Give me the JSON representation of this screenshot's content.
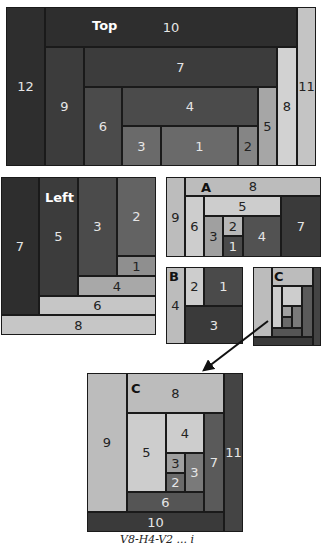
{
  "colors": {
    "g1": "#2e2e2e",
    "g2": "#383838",
    "g3": "#444444",
    "g4": "#525252",
    "g5": "#636363",
    "g6": "#777777",
    "g7": "#8f8f8f",
    "g8": "#a8a8a8",
    "g9": "#bcbcbc",
    "g10": "#cdcdcd"
  },
  "diagrams": [
    {
      "id": "top",
      "tag": {
        "label": "Top",
        "x": 92,
        "y": 18,
        "color": "#ffffff"
      },
      "cells": [
        {
          "label": "12",
          "x": 6,
          "y": 7,
          "w": 39,
          "h": 159,
          "bg": "#2e2e2e",
          "fg": "#e6e6e6"
        },
        {
          "label": "10",
          "x": 45,
          "y": 7,
          "w": 252,
          "h": 40,
          "bg": "#2e2e2e",
          "fg": "#e6e6e6"
        },
        {
          "label": "11",
          "x": 297,
          "y": 7,
          "w": 19,
          "h": 159,
          "bg": "#c4c4c4",
          "fg": "#222222"
        },
        {
          "label": "9",
          "x": 45,
          "y": 47,
          "w": 39,
          "h": 119,
          "bg": "#3c3c3c",
          "fg": "#e6e6e6"
        },
        {
          "label": "7",
          "x": 84,
          "y": 47,
          "w": 193,
          "h": 40,
          "bg": "#3c3c3c",
          "fg": "#e6e6e6"
        },
        {
          "label": "8",
          "x": 277,
          "y": 47,
          "w": 20,
          "h": 119,
          "bg": "#d2d2d2",
          "fg": "#222222"
        },
        {
          "label": "6",
          "x": 84,
          "y": 87,
          "w": 38,
          "h": 79,
          "bg": "#4b4b4b",
          "fg": "#e6e6e6"
        },
        {
          "label": "4",
          "x": 122,
          "y": 87,
          "w": 136,
          "h": 39,
          "bg": "#4b4b4b",
          "fg": "#e6e6e6"
        },
        {
          "label": "5",
          "x": 258,
          "y": 87,
          "w": 19,
          "h": 79,
          "bg": "#a6a6a6",
          "fg": "#222222"
        },
        {
          "label": "3",
          "x": 122,
          "y": 126,
          "w": 39,
          "h": 40,
          "bg": "#6a6a6a",
          "fg": "#e6e6e6"
        },
        {
          "label": "1",
          "x": 161,
          "y": 126,
          "w": 77,
          "h": 40,
          "bg": "#6a6a6a",
          "fg": "#e6e6e6"
        },
        {
          "label": "2",
          "x": 238,
          "y": 126,
          "w": 20,
          "h": 40,
          "bg": "#858585",
          "fg": "#222222"
        }
      ]
    },
    {
      "id": "left",
      "tag": {
        "label": "Left",
        "x": 45,
        "y": 190,
        "color": "#ffffff"
      },
      "cells": [
        {
          "label": "7",
          "x": 1,
          "y": 177,
          "w": 38,
          "h": 138,
          "bg": "#2e2e2e",
          "fg": "#e6e6e6"
        },
        {
          "label": "5",
          "x": 39,
          "y": 177,
          "w": 39,
          "h": 119,
          "bg": "#3c3c3c",
          "fg": "#e6e6e6"
        },
        {
          "label": "3",
          "x": 78,
          "y": 177,
          "w": 39,
          "h": 99,
          "bg": "#4b4b4b",
          "fg": "#e6e6e6"
        },
        {
          "label": "2",
          "x": 117,
          "y": 177,
          "w": 39,
          "h": 79,
          "bg": "#636363",
          "fg": "#e6e6e6"
        },
        {
          "label": "1",
          "x": 117,
          "y": 256,
          "w": 39,
          "h": 20,
          "bg": "#8f8f8f",
          "fg": "#222222"
        },
        {
          "label": "4",
          "x": 78,
          "y": 276,
          "w": 78,
          "h": 20,
          "bg": "#a8a8a8",
          "fg": "#222222"
        },
        {
          "label": "6",
          "x": 39,
          "y": 296,
          "w": 117,
          "h": 19,
          "bg": "#c6c6c6",
          "fg": "#222222"
        },
        {
          "label": "8",
          "x": 1,
          "y": 315,
          "w": 155,
          "h": 20,
          "bg": "#c6c6c6",
          "fg": "#222222"
        }
      ]
    },
    {
      "id": "a",
      "tag": {
        "label": "A",
        "x": 201,
        "y": 180,
        "color": "#111111"
      },
      "cells": [
        {
          "label": "9",
          "x": 166,
          "y": 177,
          "w": 19,
          "h": 80,
          "bg": "#bcbcbc",
          "fg": "#222222"
        },
        {
          "label": "8",
          "x": 185,
          "y": 177,
          "w": 136,
          "h": 19,
          "bg": "#bcbcbc",
          "fg": "#222222"
        },
        {
          "label": "6",
          "x": 185,
          "y": 196,
          "w": 19,
          "h": 61,
          "bg": "#cdcdcd",
          "fg": "#222222"
        },
        {
          "label": "5",
          "x": 204,
          "y": 196,
          "w": 77,
          "h": 20,
          "bg": "#cdcdcd",
          "fg": "#222222"
        },
        {
          "label": "7",
          "x": 281,
          "y": 196,
          "w": 40,
          "h": 61,
          "bg": "#3a3a3a",
          "fg": "#e6e6e6"
        },
        {
          "label": "3",
          "x": 204,
          "y": 216,
          "w": 19,
          "h": 41,
          "bg": "#a0a0a0",
          "fg": "#222222"
        },
        {
          "label": "2",
          "x": 223,
          "y": 216,
          "w": 20,
          "h": 20,
          "bg": "#b8b8b8",
          "fg": "#222222"
        },
        {
          "label": "1",
          "x": 223,
          "y": 236,
          "w": 20,
          "h": 21,
          "bg": "#4a4a4a",
          "fg": "#e6e6e6"
        },
        {
          "label": "4",
          "x": 243,
          "y": 216,
          "w": 38,
          "h": 41,
          "bg": "#525252",
          "fg": "#e6e6e6"
        }
      ]
    },
    {
      "id": "b",
      "tag": {
        "label": "B",
        "x": 169,
        "y": 269,
        "color": "#111111"
      },
      "cells": [
        {
          "label": "4",
          "x": 166,
          "y": 267,
          "w": 19,
          "h": 77,
          "bg": "#bcbcbc",
          "fg": "#222222"
        },
        {
          "label": "2",
          "x": 185,
          "y": 267,
          "w": 19,
          "h": 39,
          "bg": "#cdcdcd",
          "fg": "#222222"
        },
        {
          "label": "1",
          "x": 204,
          "y": 267,
          "w": 39,
          "h": 39,
          "bg": "#4a4a4a",
          "fg": "#e6e6e6"
        },
        {
          "label": "3",
          "x": 185,
          "y": 306,
          "w": 58,
          "h": 38,
          "bg": "#3a3a3a",
          "fg": "#e6e6e6"
        }
      ]
    },
    {
      "id": "c-small",
      "tag": {
        "label": "C",
        "x": 274,
        "y": 269,
        "color": "#111111"
      },
      "cells": [
        {
          "label": "",
          "x": 253,
          "y": 267,
          "w": 19,
          "h": 70,
          "bg": "#bcbcbc",
          "fg": "#222222"
        },
        {
          "label": "",
          "x": 272,
          "y": 267,
          "w": 41,
          "h": 19,
          "bg": "#bcbcbc",
          "fg": "#222222"
        },
        {
          "label": "",
          "x": 313,
          "y": 267,
          "w": 8,
          "h": 79,
          "bg": "#444444",
          "fg": "#e6e6e6"
        },
        {
          "label": "",
          "x": 253,
          "y": 337,
          "w": 60,
          "h": 9,
          "bg": "#3a3a3a",
          "fg": "#e6e6e6"
        },
        {
          "label": "",
          "x": 272,
          "y": 286,
          "w": 10,
          "h": 42,
          "bg": "#cdcdcd",
          "fg": "#222222"
        },
        {
          "label": "",
          "x": 282,
          "y": 286,
          "w": 20,
          "h": 20,
          "bg": "#cdcdcd",
          "fg": "#222222"
        },
        {
          "label": "",
          "x": 302,
          "y": 286,
          "w": 11,
          "h": 51,
          "bg": "#5a5a5a",
          "fg": "#e6e6e6"
        },
        {
          "label": "",
          "x": 272,
          "y": 328,
          "w": 30,
          "h": 9,
          "bg": "#555555",
          "fg": "#e6e6e6"
        },
        {
          "label": "",
          "x": 282,
          "y": 306,
          "w": 10,
          "h": 11,
          "bg": "#a0a0a0",
          "fg": "#222222"
        },
        {
          "label": "",
          "x": 282,
          "y": 317,
          "w": 10,
          "h": 11,
          "bg": "#6a6a6a",
          "fg": "#e6e6e6"
        },
        {
          "label": "",
          "x": 292,
          "y": 306,
          "w": 10,
          "h": 22,
          "bg": "#7a7a7a",
          "fg": "#e6e6e6"
        }
      ]
    },
    {
      "id": "c-large",
      "tag": {
        "label": "C",
        "x": 131,
        "y": 381,
        "color": "#111111"
      },
      "cells": [
        {
          "label": "9",
          "x": 87,
          "y": 373,
          "w": 40,
          "h": 139,
          "bg": "#bcbcbc",
          "fg": "#222222"
        },
        {
          "label": "8",
          "x": 127,
          "y": 373,
          "w": 97,
          "h": 40,
          "bg": "#bcbcbc",
          "fg": "#222222"
        },
        {
          "label": "11",
          "x": 224,
          "y": 373,
          "w": 19,
          "h": 159,
          "bg": "#444444",
          "fg": "#e6e6e6"
        },
        {
          "label": "10",
          "x": 87,
          "y": 512,
          "w": 137,
          "h": 20,
          "bg": "#3a3a3a",
          "fg": "#e6e6e6"
        },
        {
          "label": "5",
          "x": 127,
          "y": 413,
          "w": 39,
          "h": 79,
          "bg": "#cdcdcd",
          "fg": "#222222"
        },
        {
          "label": "4",
          "x": 166,
          "y": 413,
          "w": 38,
          "h": 40,
          "bg": "#cdcdcd",
          "fg": "#222222"
        },
        {
          "label": "7",
          "x": 204,
          "y": 413,
          "w": 20,
          "h": 99,
          "bg": "#5a5a5a",
          "fg": "#e6e6e6"
        },
        {
          "label": "6",
          "x": 127,
          "y": 492,
          "w": 77,
          "h": 20,
          "bg": "#555555",
          "fg": "#e6e6e6"
        },
        {
          "label": "3",
          "x": 166,
          "y": 453,
          "w": 19,
          "h": 20,
          "bg": "#a0a0a0",
          "fg": "#222222"
        },
        {
          "label": "2",
          "x": 166,
          "y": 473,
          "w": 19,
          "h": 19,
          "bg": "#6a6a6a",
          "fg": "#e6e6e6"
        },
        {
          "label": "3",
          "x": 185,
          "y": 453,
          "w": 19,
          "h": 39,
          "bg": "#7a7a7a",
          "fg": "#e6e6e6"
        }
      ]
    }
  ],
  "arrow": {
    "x1": 268,
    "y1": 321,
    "x2": 204,
    "y2": 370,
    "color": "#111111"
  },
  "caption": "V8-H4-V2 ...   i"
}
